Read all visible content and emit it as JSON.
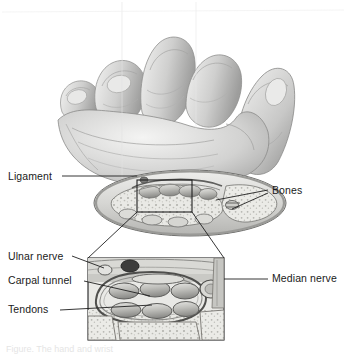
{
  "figure": {
    "background_color": "#ffffff",
    "text_color": "#1a1a1a",
    "line_color": "#222222",
    "palette": {
      "tissue_light": "#f0f0ee",
      "tissue_mid": "#c9c9c5",
      "tissue_dark": "#8d8d8a",
      "outline": "#5e5e5c",
      "skin_light": "#ededec",
      "skin_mid": "#c6c6c5",
      "skin_shadow": "#9a9a99"
    }
  },
  "labels": {
    "left": [
      {
        "id": "ligament",
        "text": "Ligament",
        "x": 8,
        "y": 171
      },
      {
        "id": "ulnar-nerve",
        "text": "Ulnar nerve",
        "x": 8,
        "y": 253
      },
      {
        "id": "carpal-tunnel",
        "text": "Carpal tunnel",
        "x": 8,
        "y": 276
      },
      {
        "id": "tendons",
        "text": "Tendons",
        "x": 8,
        "y": 305
      }
    ],
    "right": [
      {
        "id": "bones",
        "text": "Bones",
        "x": 272,
        "y": 187
      },
      {
        "id": "median-nerve",
        "text": "Median nerve",
        "x": 272,
        "y": 274
      }
    ]
  },
  "leader_lines": [
    {
      "id": "ligament-leader",
      "from": [
        62,
        176
      ],
      "to": [
        137,
        176
      ]
    },
    {
      "id": "ulnar-nerve-leader",
      "from": [
        70,
        256
      ],
      "to": [
        104,
        268
      ]
    },
    {
      "id": "carpal-tunnel-leader",
      "from": [
        82,
        281
      ],
      "to": [
        150,
        296
      ]
    },
    {
      "id": "tendons-leader",
      "from": [
        62,
        310
      ],
      "to": [
        152,
        305
      ]
    },
    {
      "id": "bones-leader-a",
      "from": [
        268,
        191
      ],
      "to": [
        214,
        203
      ]
    },
    {
      "id": "bones-leader-b",
      "from": [
        268,
        193
      ],
      "to": [
        228,
        208
      ]
    },
    {
      "id": "median-nerve-leader",
      "from": [
        268,
        279
      ],
      "to": [
        224,
        279
      ]
    }
  ],
  "callout": {
    "id": "wrist-detail-box",
    "rect": {
      "x": 137,
      "y": 180,
      "w": 55,
      "h": 32
    },
    "connectors": [
      {
        "from": [
          137,
          212
        ],
        "to": [
          88,
          258
        ]
      },
      {
        "from": [
          192,
          212
        ],
        "to": [
          224,
          258
        ]
      }
    ]
  },
  "inset": {
    "id": "magnified-cross-section",
    "rect": {
      "x": 88,
      "y": 258,
      "w": 136,
      "h": 82
    },
    "contents": [
      "ulnar-nerve-vessel",
      "carpal-ligament-band",
      "median-nerve",
      "flexor-tendons-upper-row",
      "flexor-tendons-lower-row",
      "carpal-bone-trabecular"
    ]
  },
  "caption": {
    "text": "Figure. The hand and wrist",
    "truncated": true
  }
}
